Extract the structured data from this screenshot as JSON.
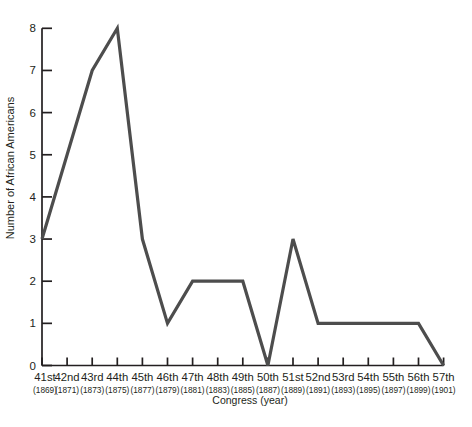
{
  "chart_data": {
    "type": "line",
    "title": "",
    "xlabel": "Congress (year)",
    "ylabel": "Number of African Americans",
    "categories": [
      "41st",
      "42nd",
      "43rd",
      "44th",
      "45th",
      "46th",
      "47th",
      "48th",
      "49th",
      "50th",
      "51st",
      "52nd",
      "53rd",
      "54th",
      "55th",
      "56th",
      "57th"
    ],
    "category_years": [
      "(1869)",
      "(1871)",
      "(1873)",
      "(1875)",
      "(1877)",
      "(1879)",
      "(1881)",
      "(1883)",
      "(1885)",
      "(1887)",
      "(1889)",
      "(1891)",
      "(1893)",
      "(1895)",
      "(1897)",
      "(1899)",
      "(1901)"
    ],
    "series": [
      {
        "name": "Number of African Americans in Congress",
        "values": [
          3,
          5,
          7,
          8,
          3,
          1,
          2,
          2,
          2,
          0,
          3,
          1,
          1,
          1,
          1,
          1,
          0
        ]
      }
    ],
    "ylim": [
      0,
      8
    ],
    "yticks": [
      0,
      1,
      2,
      3,
      4,
      5,
      6,
      7,
      8
    ],
    "grid": false,
    "legend_position": "none",
    "colors": {
      "line": "#4d4d4d",
      "axis": "#231f20",
      "text": "#231f20",
      "background": "#ffffff"
    }
  }
}
